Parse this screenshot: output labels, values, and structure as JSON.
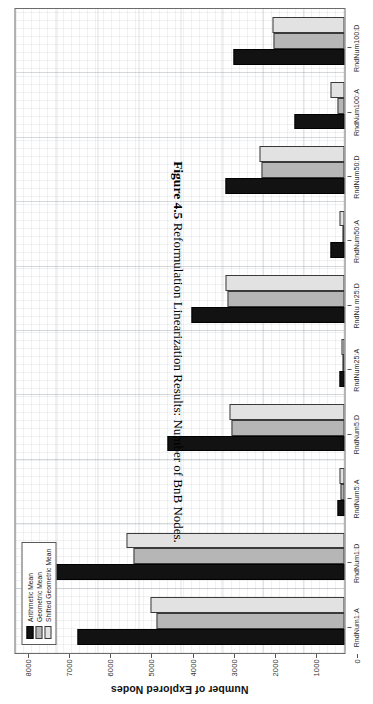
{
  "caption": {
    "number": "Figure 4.5",
    "text": "Reformulation Linearization Results: Number of BnB Nodes."
  },
  "chart_data": {
    "type": "bar",
    "orientation": "horizontal",
    "title": "",
    "xlabel": "",
    "ylabel": "Number of Explored Nodes",
    "ylim": [
      0,
      8000
    ],
    "ytick_labels": [
      "0",
      "1000",
      "2000",
      "3000",
      "4000",
      "5000",
      "6000",
      "7000",
      "8000"
    ],
    "ytick_values": [
      0,
      1000,
      2000,
      3000,
      4000,
      5000,
      6000,
      7000,
      8000
    ],
    "grid": true,
    "legend_position": "top-left",
    "categories": [
      "RndNum1:A",
      "RndNum1:D",
      "RndNum5:A",
      "RndNum5:D",
      "RndNum25:A",
      "RndNu m25:D",
      "RndNum50:A",
      "RndNum50:D",
      "RndNum100:A",
      "RndNum100:D"
    ],
    "series": [
      {
        "name": "Arithmetic Mean",
        "color": "#121212",
        "values": [
          6500,
          7220,
          180,
          4300,
          130,
          3720,
          330,
          2890,
          1220,
          2700
        ]
      },
      {
        "name": "Geometric Mean",
        "color": "#b6b6b6",
        "values": [
          4560,
          5130,
          95,
          2740,
          60,
          2840,
          55,
          2010,
          175,
          1720
        ]
      },
      {
        "name": "Shifted Geometric Mean",
        "color": "#e2e2e2",
        "values": [
          4720,
          5300,
          120,
          2800,
          80,
          2900,
          110,
          2060,
          330,
          1760
        ]
      }
    ]
  }
}
